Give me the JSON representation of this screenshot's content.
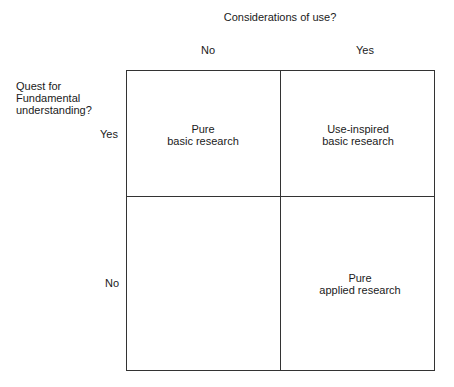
{
  "title": "Considerations of use?",
  "columns": [
    {
      "label": "No"
    },
    {
      "label": "Yes"
    }
  ],
  "rows": [
    {
      "label": "Yes"
    },
    {
      "label": "No"
    }
  ],
  "row_axis_label": {
    "line1": "Quest for",
    "line2": "Fundamental",
    "line3": "understanding?"
  },
  "cells": {
    "top_left": {
      "line1": "Pure",
      "line2": "basic research"
    },
    "top_right": {
      "line1": "Use-inspired",
      "line2": "basic research"
    },
    "bottom_left": {
      "line1": "",
      "line2": ""
    },
    "bottom_right": {
      "line1": "Pure",
      "line2": "applied research"
    }
  }
}
